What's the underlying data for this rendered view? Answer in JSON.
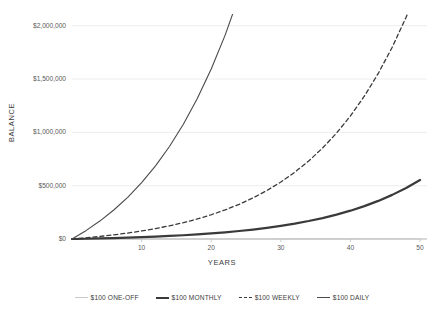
{
  "chart_data": {
    "type": "line",
    "title": "",
    "xlabel": "YEARS",
    "ylabel": "BALANCE",
    "xlim": [
      0,
      51
    ],
    "ylim": [
      0,
      2100000
    ],
    "grid": true,
    "legend_position": "bottom",
    "x_ticks": [
      "10",
      "20",
      "30",
      "40",
      "50"
    ],
    "x_tick_values": [
      10,
      20,
      30,
      40,
      50
    ],
    "y_ticks": [
      "$0",
      "$500,000",
      "$1,000,000",
      "$1,500,000",
      "$2,000,000"
    ],
    "y_tick_values": [
      0,
      500000,
      1000000,
      1500000,
      2000000
    ],
    "x": [
      0,
      2,
      4,
      6,
      8,
      10,
      12,
      14,
      16,
      18,
      20,
      22,
      24,
      26,
      28,
      30,
      32,
      34,
      36,
      38,
      40,
      42,
      44,
      46,
      48,
      50
    ],
    "series": [
      {
        "name": "$100 ONE-OFF",
        "color": "#c8c8c8",
        "style": "solid",
        "width": 1.1,
        "values": [
          100,
          115,
          131,
          150,
          172,
          197,
          225,
          258,
          295,
          338,
          387,
          443,
          507,
          580,
          664,
          761,
          871,
          997,
          1141,
          1306,
          1497,
          1713,
          1961,
          2245,
          2570,
          2942
        ]
      },
      {
        "name": "$100 MONTHLY",
        "color": "#3a3a3a",
        "style": "solid",
        "width": 2.2,
        "values": [
          0,
          2570,
          5530,
          8940,
          12860,
          17360,
          22540,
          28500,
          35360,
          43260,
          52350,
          62810,
          74850,
          88700,
          104640,
          122980,
          144080,
          168370,
          196320,
          228490,
          265520,
          308140,
          357180,
          413610,
          478540,
          553250
        ]
      },
      {
        "name": "$100 WEEKLY",
        "color": "#3a3a3a",
        "style": "dashed",
        "width": 1.3,
        "values": [
          0,
          11150,
          23980,
          38740,
          55730,
          75280,
          97780,
          123680,
          153490,
          187800,
          227290,
          272730,
          325020,
          385190,
          454430,
          534120,
          625830,
          731370,
          852840,
          992660,
          1153630,
          1338900,
          1552120,
          1797380,
          2079560,
          2404110
        ]
      },
      {
        "name": "$100 DAILY",
        "color": "#4a4a4a",
        "style": "solid",
        "width": 1.1,
        "values": [
          0,
          78200,
          168200,
          271700,
          390800,
          527900,
          685700,
          867300,
          1076200,
          1316600,
          1593300,
          1911700,
          2278100,
          2699700,
          3184900,
          3743500,
          4386400,
          5126200,
          5977400,
          6956900,
          8084100,
          9381500,
          10874900,
          12593600,
          14571000,
          16845900
        ]
      }
    ]
  },
  "legend": {
    "items": [
      {
        "label": "$100 ONE-OFF"
      },
      {
        "label": "$100 MONTHLY"
      },
      {
        "label": "$100 WEEKLY"
      },
      {
        "label": "$100 DAILY"
      }
    ]
  }
}
